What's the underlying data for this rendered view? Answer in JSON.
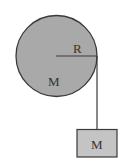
{
  "diagram": {
    "pulley": {
      "label_mass": "M",
      "label_radius": "R",
      "fill": "#a9a9a9",
      "stroke": "#3a3a3a"
    },
    "block": {
      "label": "M",
      "fill": "#c4c4c4",
      "stroke": "#3a3a3a"
    },
    "string_color": "#3a3a3a"
  }
}
